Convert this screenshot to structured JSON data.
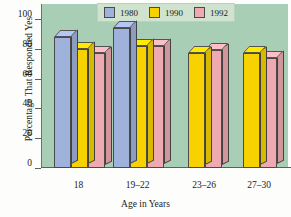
{
  "chart_data": {
    "type": "bar",
    "title": "",
    "xlabel": "Age in Years",
    "ylabel": "Percentage That Responded Yes",
    "categories": [
      "18",
      "19–22",
      "23–26",
      "27–30"
    ],
    "series": [
      {
        "name": "1980",
        "color": "#9fb2db",
        "values": [
          88,
          94,
          null,
          null
        ]
      },
      {
        "name": "1990",
        "color": "#f7d200",
        "values": [
          80,
          82,
          77,
          77
        ]
      },
      {
        "name": "1992",
        "color": "#eeaab0",
        "values": [
          77,
          82,
          79,
          74
        ]
      }
    ],
    "ylim": [
      0,
      110
    ],
    "yticks": [
      0,
      20,
      40,
      60,
      80,
      100
    ],
    "ytick_labels": [
      "0",
      "20",
      "40",
      "60",
      "80",
      "100"
    ],
    "grid": false,
    "legend_position": "top-right",
    "style": "3d-bars",
    "plot_background": "#a9ceb6",
    "legend_background": "#cfe3cf"
  },
  "legend": {
    "entries": [
      {
        "label": "1980",
        "swatch": "legend-swatch-1980"
      },
      {
        "label": "1990",
        "swatch": "legend-swatch-1990"
      },
      {
        "label": "1992",
        "swatch": "legend-swatch-1992"
      }
    ]
  }
}
